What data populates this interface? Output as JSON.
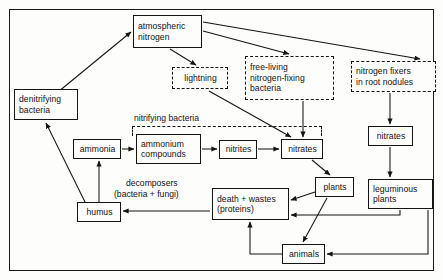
{
  "diagram": {
    "frame": {
      "border_color": "#141414"
    },
    "nodes": [
      {
        "id": "atmospheric-nitrogen",
        "lines": [
          "atmospheric",
          "nitrogen"
        ],
        "style": "solid",
        "x": 133,
        "y": 15,
        "w": 69,
        "h": 33
      },
      {
        "id": "denitrifying-bacteria",
        "lines": [
          "denitrifying",
          "bacteria"
        ],
        "style": "solid",
        "x": 14,
        "y": 89,
        "w": 64,
        "h": 31
      },
      {
        "id": "lightning",
        "lines": [
          "lightning"
        ],
        "style": "dashed",
        "x": 172,
        "y": 67,
        "w": 56,
        "h": 22
      },
      {
        "id": "free-living-nitrogen-fixing-bacteria",
        "lines": [
          "free-living",
          "nitrogen-fixing",
          "bacteria"
        ],
        "style": "dashed",
        "x": 245,
        "y": 56,
        "w": 89,
        "h": 44
      },
      {
        "id": "nitrogen-fixers-in-root-nodules",
        "lines": [
          "nitrogen fixers",
          "in root nodules"
        ],
        "style": "dashed",
        "x": 351,
        "y": 61,
        "w": 85,
        "h": 31
      },
      {
        "id": "nitrates-right",
        "lines": [
          "nitrates"
        ],
        "style": "solid",
        "x": 368,
        "y": 126,
        "w": 45,
        "h": 20
      },
      {
        "id": "ammonia",
        "lines": [
          "ammonia"
        ],
        "style": "solid",
        "x": 73,
        "y": 139,
        "w": 48,
        "h": 20
      },
      {
        "id": "ammonium-compounds",
        "lines": [
          "ammonium",
          "compounds"
        ],
        "style": "solid",
        "x": 136,
        "y": 134,
        "w": 65,
        "h": 30
      },
      {
        "id": "nitrites",
        "lines": [
          "nitrites"
        ],
        "style": "solid",
        "x": 219,
        "y": 140,
        "w": 38,
        "h": 19
      },
      {
        "id": "nitrates-main",
        "lines": [
          "nitrates"
        ],
        "style": "solid",
        "x": 281,
        "y": 139,
        "w": 42,
        "h": 20
      },
      {
        "id": "plants",
        "lines": [
          "plants"
        ],
        "style": "solid",
        "x": 315,
        "y": 177,
        "w": 39,
        "h": 20
      },
      {
        "id": "leguminous-plants",
        "lines": [
          "leguminous",
          "plants"
        ],
        "style": "solid",
        "x": 368,
        "y": 179,
        "w": 65,
        "h": 30
      },
      {
        "id": "death-and-wastes",
        "lines": [
          "death + wastes",
          "(proteins)"
        ],
        "style": "solid",
        "x": 212,
        "y": 188,
        "w": 77,
        "h": 32
      },
      {
        "id": "humus",
        "lines": [
          "humus"
        ],
        "style": "solid",
        "x": 77,
        "y": 202,
        "w": 44,
        "h": 20
      },
      {
        "id": "animals",
        "lines": [
          "animals"
        ],
        "style": "solid",
        "x": 282,
        "y": 244,
        "w": 43,
        "h": 20
      }
    ],
    "labels": [
      {
        "id": "nitrifying-bacteria-label",
        "text": "nitrifying bacteria",
        "x": 134,
        "y": 113
      },
      {
        "id": "decomposers-label-line1",
        "text": "decomposers",
        "x": 126,
        "y": 181
      },
      {
        "id": "decomposers-label-line2",
        "text": "(bacteria + fungi)",
        "x": 114,
        "y": 192
      }
    ],
    "brackets": [
      {
        "id": "nitrifying-bacteria-bracket",
        "x": 132,
        "y": 126,
        "w": 190,
        "h": 10
      }
    ],
    "edges": [
      {
        "id": "denitrifying-to-atmospheric",
        "from": "denitrifying-bacteria",
        "to": "atmospheric-nitrogen"
      },
      {
        "id": "humus-to-denitrifying",
        "from": "humus",
        "to": "denitrifying-bacteria"
      },
      {
        "id": "atmospheric-to-lightning",
        "from": "atmospheric-nitrogen",
        "to": "lightning"
      },
      {
        "id": "atmospheric-to-free-living",
        "from": "atmospheric-nitrogen",
        "to": "free-living-nitrogen-fixing-bacteria"
      },
      {
        "id": "atmospheric-to-root-nodules",
        "from": "atmospheric-nitrogen",
        "to": "nitrogen-fixers-in-root-nodules"
      },
      {
        "id": "lightning-to-nitrates",
        "from": "lightning",
        "to": "nitrates-main"
      },
      {
        "id": "free-living-to-nitrates",
        "from": "free-living-nitrogen-fixing-bacteria",
        "to": "nitrates-main"
      },
      {
        "id": "root-nodules-to-nitrates-right",
        "from": "nitrogen-fixers-in-root-nodules",
        "to": "nitrates-right"
      },
      {
        "id": "nitrates-right-to-leguminous",
        "from": "nitrates-right",
        "to": "leguminous-plants"
      },
      {
        "id": "humus-to-ammonia",
        "from": "humus",
        "to": "ammonia"
      },
      {
        "id": "ammonia-to-ammonium",
        "from": "ammonia",
        "to": "ammonium-compounds"
      },
      {
        "id": "ammonium-to-nitrites",
        "from": "ammonium-compounds",
        "to": "nitrites"
      },
      {
        "id": "nitrites-to-nitrates",
        "from": "nitrites",
        "to": "nitrates-main"
      },
      {
        "id": "nitrates-to-plants",
        "from": "nitrates-main",
        "to": "plants"
      },
      {
        "id": "plants-to-death",
        "from": "plants",
        "to": "death-and-wastes"
      },
      {
        "id": "plants-to-animals",
        "from": "plants",
        "to": "animals"
      },
      {
        "id": "animals-to-death",
        "from": "animals",
        "to": "death-and-wastes"
      },
      {
        "id": "death-to-humus",
        "from": "death-and-wastes",
        "to": "humus"
      },
      {
        "id": "leguminous-to-death",
        "from": "leguminous-plants",
        "to": "death-and-wastes"
      },
      {
        "id": "leguminous-to-animals",
        "from": "leguminous-plants",
        "to": "animals"
      }
    ]
  }
}
